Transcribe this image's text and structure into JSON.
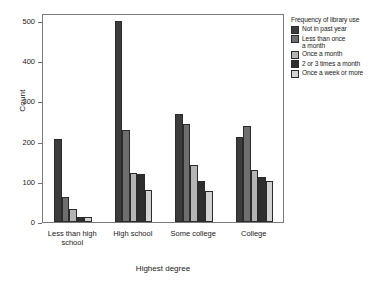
{
  "chart_data": {
    "type": "bar",
    "title": "",
    "xlabel": "Highest degree",
    "ylabel": "Count",
    "categories": [
      "Less than high school",
      "High school",
      "Some college",
      "College"
    ],
    "category_labels_wrapped": [
      "Less than high\nschool",
      "High school",
      "Some college",
      "College"
    ],
    "legend_title": "Frequency of library use",
    "legend_position": "right",
    "grid": false,
    "ylim": [
      0,
      520
    ],
    "yticks": [
      0,
      100,
      200,
      300,
      400,
      500
    ],
    "ytick_labels": [
      "0",
      "100",
      "200",
      "300",
      "400",
      "500"
    ],
    "series": [
      {
        "name": "Not in past year",
        "color": "#3c3c3c",
        "values": [
          207,
          499,
          268,
          212
        ]
      },
      {
        "name": "Less than once a month",
        "color": "#6e6e6e",
        "values": [
          63,
          228,
          243,
          240
        ]
      },
      {
        "name": "Once a month",
        "color": "#b4b4b4",
        "values": [
          33,
          121,
          142,
          130
        ]
      },
      {
        "name": "2 or 3 times a month",
        "color": "#2e2e2e",
        "values": [
          13,
          120,
          103,
          111
        ]
      },
      {
        "name": "Once a week or more",
        "color": "#d2d2d2",
        "values": [
          13,
          80,
          78,
          103
        ]
      }
    ]
  },
  "legend": {
    "title": "Frequency of library use",
    "items": [
      {
        "label": "Not in past year",
        "color": "#3c3c3c"
      },
      {
        "label": "Less than once a month",
        "color": "#6e6e6e"
      },
      {
        "label": "Once a month",
        "color": "#b4b4b4"
      },
      {
        "label": "2 or 3 times a month",
        "color": "#2e2e2e"
      },
      {
        "label": "Once a week or more",
        "color": "#d2d2d2"
      }
    ]
  },
  "axes": {
    "y_label": "Count",
    "x_label": "Highest degree",
    "y_ticks": [
      "500",
      "400",
      "300",
      "200",
      "100",
      "0"
    ],
    "x_ticks": [
      "Less than high\nschool",
      "High school",
      "Some college",
      "College"
    ]
  }
}
